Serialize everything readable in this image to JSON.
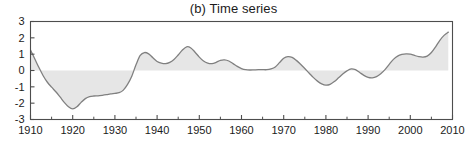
{
  "chart_data": {
    "type": "area",
    "title": "(b) Time series",
    "xlabel": "",
    "ylabel": "",
    "xlim": [
      1910,
      2010
    ],
    "ylim": [
      -3,
      3
    ],
    "grid": false,
    "legend": null,
    "xticks": [
      1910,
      1920,
      1930,
      1940,
      1950,
      1960,
      1970,
      1980,
      1990,
      2000,
      2010
    ],
    "xtick_labels": [
      "1910",
      "1920",
      "1930",
      "1940",
      "1950",
      "1960",
      "1970",
      "1980",
      "1990",
      "2000",
      "2010"
    ],
    "yticks": [
      -3,
      -2,
      -1,
      0,
      1,
      2,
      3
    ],
    "ytick_labels": [
      "-3",
      "-2",
      "-1",
      "0",
      "1",
      "2",
      "3"
    ],
    "baseline": 0,
    "fill_color": "#e6e6e6",
    "line_color": "#808080",
    "axis_color": "#4d4d4d",
    "series": [
      {
        "name": "smoothed index",
        "x": [
          1910,
          1911,
          1912,
          1913,
          1914,
          1915,
          1916,
          1917,
          1918,
          1919,
          1920,
          1921,
          1922,
          1923,
          1924,
          1925,
          1926,
          1927,
          1928,
          1929,
          1930,
          1931,
          1932,
          1933,
          1934,
          1935,
          1936,
          1937,
          1938,
          1939,
          1940,
          1941,
          1942,
          1943,
          1944,
          1945,
          1946,
          1947,
          1948,
          1949,
          1950,
          1951,
          1952,
          1953,
          1954,
          1955,
          1956,
          1957,
          1958,
          1959,
          1960,
          1961,
          1962,
          1963,
          1964,
          1965,
          1966,
          1967,
          1968,
          1969,
          1970,
          1971,
          1972,
          1973,
          1974,
          1975,
          1976,
          1977,
          1978,
          1979,
          1980,
          1981,
          1982,
          1983,
          1984,
          1985,
          1986,
          1987,
          1988,
          1989,
          1990,
          1991,
          1992,
          1993,
          1994,
          1995,
          1996,
          1997,
          1998,
          1999,
          2000,
          2001,
          2002,
          2003,
          2004,
          2005,
          2006,
          2007,
          2008,
          2009
        ],
        "values": [
          1.25,
          0.72,
          0.18,
          -0.32,
          -0.72,
          -1.02,
          -1.3,
          -1.62,
          -1.95,
          -2.22,
          -2.35,
          -2.22,
          -1.95,
          -1.72,
          -1.6,
          -1.56,
          -1.55,
          -1.52,
          -1.48,
          -1.43,
          -1.4,
          -1.36,
          -1.2,
          -0.85,
          -0.35,
          0.35,
          0.92,
          1.1,
          1.02,
          0.78,
          0.55,
          0.45,
          0.42,
          0.5,
          0.68,
          0.95,
          1.25,
          1.45,
          1.38,
          1.12,
          0.82,
          0.58,
          0.45,
          0.42,
          0.5,
          0.62,
          0.65,
          0.58,
          0.42,
          0.25,
          0.12,
          0.05,
          0.03,
          0.04,
          0.05,
          0.05,
          0.05,
          0.1,
          0.22,
          0.48,
          0.75,
          0.85,
          0.8,
          0.62,
          0.38,
          0.12,
          -0.15,
          -0.42,
          -0.65,
          -0.82,
          -0.9,
          -0.85,
          -0.68,
          -0.45,
          -0.22,
          -0.02,
          0.1,
          0.05,
          -0.12,
          -0.3,
          -0.42,
          -0.45,
          -0.38,
          -0.2,
          0.05,
          0.38,
          0.68,
          0.88,
          0.98,
          1.02,
          1.0,
          0.92,
          0.85,
          0.82,
          0.88,
          1.1,
          1.45,
          1.85,
          2.15,
          2.35
        ]
      }
    ]
  }
}
